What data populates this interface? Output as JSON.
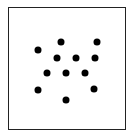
{
  "diagram": {
    "type": "dot-pattern",
    "frame": {
      "border_color": "#222222",
      "background": "#ffffff"
    },
    "dot_color": "#000000",
    "dot_count": 12,
    "dots": [
      {
        "x": 61,
        "y": 42
      },
      {
        "x": 97,
        "y": 42
      },
      {
        "x": 38,
        "y": 50
      },
      {
        "x": 57,
        "y": 58
      },
      {
        "x": 76,
        "y": 58
      },
      {
        "x": 95,
        "y": 58
      },
      {
        "x": 47,
        "y": 73
      },
      {
        "x": 66,
        "y": 73
      },
      {
        "x": 85,
        "y": 73
      },
      {
        "x": 38,
        "y": 90
      },
      {
        "x": 94,
        "y": 89
      },
      {
        "x": 66,
        "y": 100
      }
    ]
  }
}
